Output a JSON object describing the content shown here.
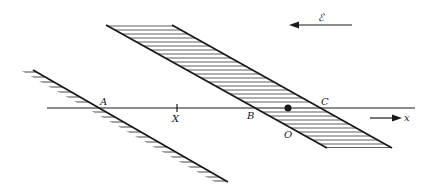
{
  "diagram": {
    "type": "physics-geometry",
    "colors": {
      "ink": "#1a1a1a",
      "background": "#ffffff"
    },
    "labels": {
      "A": "A",
      "X": "X",
      "B": "B",
      "C": "C",
      "O": "O",
      "field": "ℰ",
      "axis": "x"
    },
    "points": {
      "A": [
        98,
        108
      ],
      "X": [
        177,
        108
      ],
      "B": [
        250,
        108
      ],
      "C": [
        322,
        108
      ],
      "O": [
        286,
        134
      ],
      "dot": [
        288,
        108
      ]
    }
  }
}
